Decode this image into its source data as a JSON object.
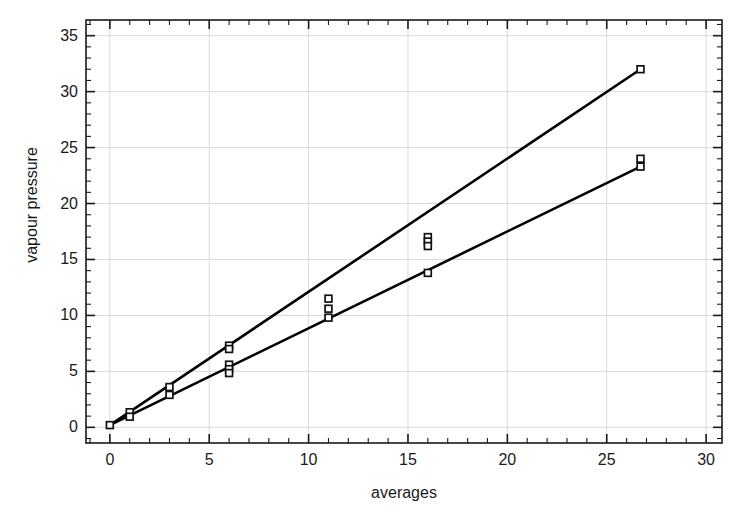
{
  "chart_data": {
    "type": "scatter",
    "title": "",
    "xlabel": "averages",
    "ylabel": "vapour pressure",
    "xlim": [
      -1.2,
      30.8
    ],
    "ylim": [
      -1.4,
      36.4
    ],
    "xticks": [
      0,
      5,
      10,
      15,
      20,
      25,
      30
    ],
    "xtick_labels": [
      "0",
      "5",
      "10",
      "15",
      "20",
      "25",
      "30"
    ],
    "yticks": [
      0,
      5,
      10,
      15,
      20,
      25,
      30,
      35
    ],
    "ytick_labels": [
      "0",
      "5",
      "10",
      "15",
      "20",
      "25",
      "30",
      "35"
    ],
    "x_minor_tick_interval": 1,
    "y_minor_tick_interval": 1,
    "grid": true,
    "grid_color": "#d9d9d9",
    "legend": "none",
    "marker": "open-square",
    "marker_color": "#111111",
    "line_color": "#000000",
    "line_width": 2.6,
    "series": [
      {
        "name": "upper-line",
        "type": "line",
        "x": [
          0.0,
          26.7
        ],
        "y": [
          0.2,
          32.0
        ]
      },
      {
        "name": "lower-line",
        "type": "line",
        "x": [
          0.0,
          26.7
        ],
        "y": [
          0.2,
          23.3
        ]
      },
      {
        "name": "points",
        "type": "scatter",
        "x": [
          0.0,
          1.0,
          1.0,
          3.0,
          3.0,
          6.0,
          6.0,
          6.0,
          6.0,
          6.0,
          11.0,
          11.0,
          11.0,
          16.0,
          16.0,
          16.0,
          16.0,
          26.7,
          26.7,
          26.7
        ],
        "y": [
          0.2,
          1.35,
          0.95,
          3.6,
          2.9,
          7.3,
          7.0,
          5.6,
          5.2,
          4.85,
          11.5,
          10.6,
          9.8,
          17.0,
          16.6,
          16.2,
          13.8,
          32.0,
          24.0,
          23.3
        ]
      }
    ]
  },
  "figure": {
    "background": "#ffffff",
    "axis_color": "#1a1a1a"
  }
}
